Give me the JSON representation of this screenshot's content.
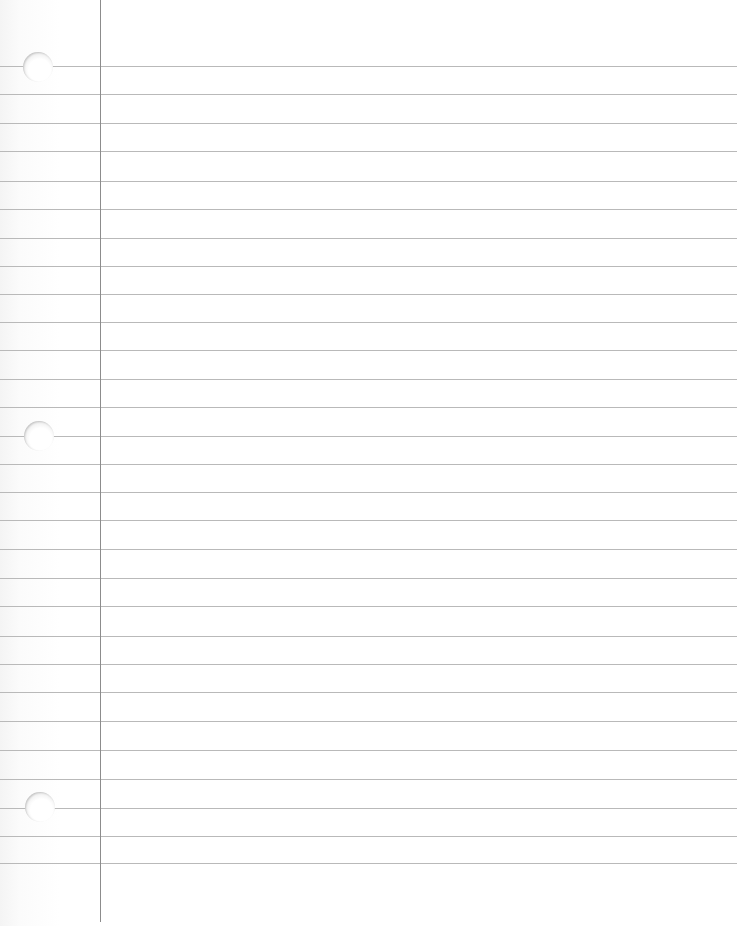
{
  "page": {
    "type": "lined-notebook-paper",
    "colors": {
      "paper": "#ffffff",
      "rule_line": "#b9b9b9",
      "margin_line": "#8c8c8c"
    },
    "margin_x": 100,
    "rule_lines_y": [
      66,
      94,
      123,
      151,
      181,
      209,
      238,
      266,
      294,
      322,
      350,
      379,
      407,
      436,
      464,
      492,
      520,
      549,
      578,
      606,
      636,
      664,
      692,
      721,
      750,
      779,
      808,
      836,
      863
    ],
    "holes": [
      {
        "cx": 38,
        "cy": 67
      },
      {
        "cx": 39,
        "cy": 436
      },
      {
        "cx": 40,
        "cy": 807
      }
    ]
  }
}
